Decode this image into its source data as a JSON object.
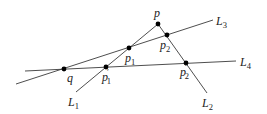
{
  "diagram": {
    "colors": {
      "line": "#3a3a3a",
      "point": "#000000",
      "text": "#222222"
    },
    "points": {
      "p": {
        "label": "p",
        "sub": "",
        "prime": "",
        "x": 158,
        "y": 24
      },
      "p1": {
        "label": "p",
        "sub": "1",
        "prime": "",
        "x": 129,
        "y": 48
      },
      "p2": {
        "label": "p",
        "sub": "2",
        "prime": "",
        "x": 167,
        "y": 35
      },
      "q": {
        "label": "q",
        "sub": "",
        "prime": "",
        "x": 64,
        "y": 69
      },
      "p1p": {
        "label": "p",
        "sub": "1",
        "prime": "′",
        "x": 106,
        "y": 67
      },
      "p2p": {
        "label": "p",
        "sub": "2",
        "prime": "′",
        "x": 186,
        "y": 63
      }
    },
    "lines": {
      "L1": {
        "label": "L",
        "sub": "1"
      },
      "L2": {
        "label": "L",
        "sub": "2"
      },
      "L3": {
        "label": "L",
        "sub": "3"
      },
      "L4": {
        "label": "L",
        "sub": "4"
      }
    }
  }
}
